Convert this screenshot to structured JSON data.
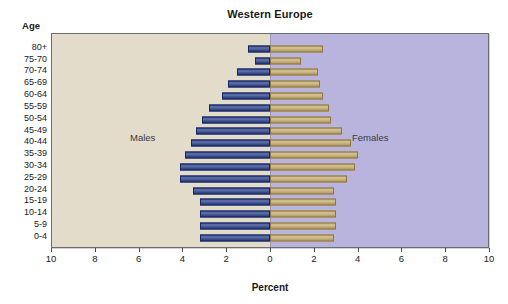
{
  "chart_data": {
    "type": "bar",
    "title": "Western Europe",
    "xlabel": "Percent",
    "ylabel": "Age",
    "orientation": "horizontal",
    "layout": "population-pyramid",
    "grid": false,
    "legend_position": "inside-panel",
    "xlim": [
      -10,
      10
    ],
    "x_tick_labels": [
      "10",
      "8",
      "6",
      "4",
      "2",
      "0",
      "2",
      "4",
      "6",
      "8",
      "10"
    ],
    "x_tick_values": [
      -10,
      -8,
      -6,
      -4,
      -2,
      0,
      2,
      4,
      6,
      8,
      10
    ],
    "categories": [
      "80+",
      "75-70",
      "70-74",
      "65-69",
      "60-64",
      "55-59",
      "50-54",
      "45-49",
      "40-44",
      "35-39",
      "30-34",
      "25-29",
      "20-24",
      "15-19",
      "10-14",
      "5-9",
      "0-4"
    ],
    "series": [
      {
        "name": "Males",
        "side": "left",
        "color": "#2a3f87",
        "values": [
          1.0,
          0.7,
          1.5,
          1.9,
          2.2,
          2.8,
          3.1,
          3.4,
          3.6,
          3.9,
          4.1,
          4.1,
          3.5,
          3.2,
          3.2,
          3.2,
          3.2
        ]
      },
      {
        "name": "Females",
        "side": "right",
        "color": "#bda363",
        "values": [
          2.4,
          1.4,
          2.2,
          2.3,
          2.4,
          2.7,
          2.8,
          3.3,
          3.7,
          4.0,
          3.9,
          3.5,
          2.9,
          3.0,
          3.0,
          3.0,
          2.9
        ]
      }
    ],
    "annotations": [
      {
        "text": "Males",
        "panel": "left"
      },
      {
        "text": "Females",
        "panel": "right"
      }
    ],
    "colors": {
      "males_bar": "#2a3f87",
      "females_bar": "#bda363",
      "males_panel_bg": "#e3dcca",
      "females_panel_bg": "#b9b4de",
      "frame": "#6d6d70"
    }
  }
}
